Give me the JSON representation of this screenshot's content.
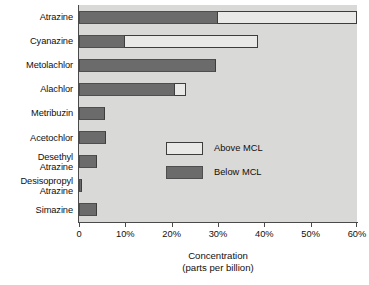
{
  "chart_data": {
    "type": "bar",
    "orientation": "horizontal",
    "stacked": true,
    "title": "",
    "xlabel": "Concentration",
    "xlabel_line2": "(parts per billion)",
    "ylabel": "",
    "xlim": [
      0,
      60
    ],
    "xticks": [
      0,
      10,
      20,
      30,
      40,
      50,
      60
    ],
    "xtick_labels": [
      "0",
      "10%",
      "20%",
      "30%",
      "40%",
      "50%",
      "60%"
    ],
    "grid": false,
    "legend_position": "inside-lower-right",
    "categories": [
      "Atrazine",
      "Cyanazine",
      "Metolachlor",
      "Alachlor",
      "Metribuzin",
      "Acetochlor",
      "Desethyl\nAtrazine",
      "Desisopropyl\nAtrazine",
      "Simazine"
    ],
    "series": [
      {
        "name": "Below MCL",
        "color": "#6b6b6b",
        "values": [
          30.0,
          10.0,
          29.5,
          20.8,
          5.6,
          5.8,
          3.8,
          0.7,
          3.8
        ]
      },
      {
        "name": "Above MCL",
        "color": "#e9e9e7",
        "values": [
          30.0,
          28.6,
          0.0,
          2.2,
          0.0,
          0.0,
          0.0,
          0.0,
          0.0
        ]
      }
    ],
    "totals": [
      60.0,
      38.6,
      29.5,
      23.0,
      5.6,
      5.8,
      3.8,
      0.7,
      3.8
    ],
    "colors": {
      "plot_background": "#d9d9d7",
      "page_background": "#ffffff",
      "axis": "#4a4a4a",
      "below_mcl": "#6b6b6b",
      "above_mcl": "#e9e9e7",
      "bar_outline": "#3d3d3d",
      "text": "#101010"
    }
  },
  "legend": {
    "items": [
      {
        "label": "Above MCL",
        "key": "above"
      },
      {
        "label": "Below MCL",
        "key": "below"
      }
    ]
  }
}
